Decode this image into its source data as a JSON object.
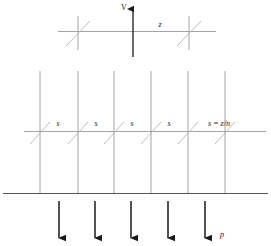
{
  "figure": {
    "title": "",
    "background_color": "#ffffff",
    "line_color_thin": "#9a9a9a",
    "line_color_bold": "#1a1a1a",
    "hatch_color": "#b0b0b0",
    "text_color": "#1a1a1a",
    "labels": {
      "velocity": "V",
      "span_total": "z",
      "segment_1": "s",
      "segment_2": "s",
      "segment_3": "s",
      "segment_4": "s",
      "segment_equation": "s = z/n",
      "load": "p"
    },
    "panels": {
      "top": {
        "name": "single-span-beam",
        "beam_y": 31,
        "beam_x_start": 58,
        "beam_x_end": 216,
        "supports_x": [
          78,
          189
        ],
        "arrow": {
          "x": 133,
          "y_base": 57,
          "y_tip": 6,
          "direction": "up"
        }
      },
      "middle": {
        "name": "multi-span-beam",
        "beam_y": 131,
        "beam_x_start": 24,
        "beam_x_end": 266,
        "columns_x": [
          40,
          78,
          114,
          151,
          188,
          225
        ],
        "column_y_top": 71,
        "column_y_bottom": 193,
        "segment_label_x": [
          58,
          96,
          132,
          169
        ],
        "segment_label_y": 125,
        "equation_label_x": 219,
        "equation_label_y": 125
      },
      "bottom": {
        "name": "distributed-load",
        "ground_y": 193,
        "ground_x_start": 3,
        "ground_x_end": 268,
        "arrows_x": [
          59,
          95,
          131,
          168,
          205
        ],
        "arrow_y_base": 201,
        "arrow_y_tip": 240,
        "load_label_x": 222,
        "load_label_y": 236
      }
    }
  }
}
